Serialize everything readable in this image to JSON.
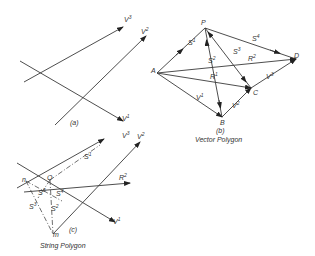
{
  "figure": {
    "panels": [
      {
        "id": "a",
        "caption": "(a)",
        "title": "",
        "vectors": [
          {
            "label": "V",
            "sup": "3"
          },
          {
            "label": "V",
            "sup": "2"
          },
          {
            "label": "V",
            "sup": "1"
          }
        ]
      },
      {
        "id": "b",
        "caption": "(b)",
        "title": "Vector Polygon",
        "points": [
          "P",
          "A",
          "B",
          "C",
          "D"
        ],
        "vectors": [
          {
            "label": "S",
            "sup": "1"
          },
          {
            "label": "S",
            "sup": "4"
          },
          {
            "label": "S",
            "sup": "2"
          },
          {
            "label": "S",
            "sup": "3"
          },
          {
            "label": "R",
            "sup": "2"
          },
          {
            "label": "R",
            "sup": "1"
          },
          {
            "label": "V",
            "sup": "1"
          },
          {
            "label": "V",
            "sup": "2"
          },
          {
            "label": "V",
            "sup": "3"
          }
        ]
      },
      {
        "id": "c",
        "caption": "(c)",
        "title": "String Polygon",
        "points": [
          "n",
          "O",
          "m"
        ],
        "vectors": [
          {
            "label": "V",
            "sup": "3"
          },
          {
            "label": "V",
            "sup": "2"
          },
          {
            "label": "V",
            "sup": "1"
          },
          {
            "label": "S",
            "sup": "1"
          },
          {
            "label": "R",
            "sup": "2"
          },
          {
            "label": "S",
            "sup": "3"
          },
          {
            "label": "S",
            "sup": "4"
          },
          {
            "label": "S",
            "sup": "2"
          },
          {
            "label": "S",
            "sup": "3"
          }
        ]
      }
    ]
  }
}
